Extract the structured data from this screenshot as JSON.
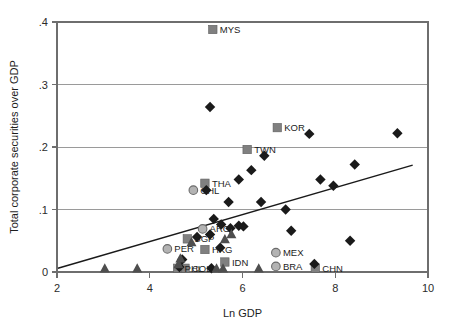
{
  "chart_data": {
    "type": "scatter",
    "title": "",
    "xlabel": "Ln GDP",
    "ylabel": "Total corporate securities over GDP",
    "xlim": [
      2,
      10
    ],
    "ylim": [
      0,
      0.4
    ],
    "xticks": [
      "2",
      "4",
      "6",
      "8",
      "10"
    ],
    "xtick_values": [
      2,
      4,
      6,
      8,
      10
    ],
    "yticks": [
      "0",
      ".1",
      ".2",
      ".3",
      ".4"
    ],
    "ytick_values": [
      0,
      0.1,
      0.2,
      0.3,
      0.4
    ],
    "grid": "horizontal",
    "legend_position": "none",
    "trendline": {
      "name": "fitted-line",
      "x_start": 2.02,
      "y_start": 0.006,
      "x_end": 9.67,
      "y_end": 0.171
    },
    "series": [
      {
        "name": "Labeled emerging markets",
        "marker": "square",
        "color": "#808080",
        "points": [
          {
            "label": "MYS",
            "x": 5.36,
            "y": 0.388
          },
          {
            "label": "KOR",
            "x": 6.75,
            "y": 0.231
          },
          {
            "label": "TWN",
            "x": 6.1,
            "y": 0.196
          },
          {
            "label": "THA",
            "x": 5.19,
            "y": 0.142
          },
          {
            "label": "SGP",
            "x": 4.81,
            "y": 0.053
          },
          {
            "label": "HKG",
            "x": 5.19,
            "y": 0.036
          },
          {
            "label": "IDN",
            "x": 5.62,
            "y": 0.016
          },
          {
            "label": "COL",
            "x": 4.76,
            "y": 0.006
          },
          {
            "label": "PHL",
            "x": 4.6,
            "y": 0.006
          },
          {
            "label": "CHN",
            "x": 7.57,
            "y": 0.006
          }
        ]
      },
      {
        "name": "Labeled emerging markets (circle)",
        "marker": "circle",
        "color": "#b3b3b3",
        "points": [
          {
            "label": "CHL",
            "x": 4.94,
            "y": 0.131
          },
          {
            "label": "ARG",
            "x": 5.14,
            "y": 0.069
          },
          {
            "label": "PER",
            "x": 4.38,
            "y": 0.037
          },
          {
            "label": "MEX",
            "x": 6.72,
            "y": 0.031
          },
          {
            "label": "BRA",
            "x": 6.72,
            "y": 0.009
          }
        ]
      },
      {
        "name": "Unlabeled observations (diamond)",
        "marker": "diamond",
        "color": "#1a1a1a",
        "points": [
          {
            "label": "",
            "x": 5.3,
            "y": 0.264
          },
          {
            "label": "",
            "x": 7.44,
            "y": 0.221
          },
          {
            "label": "",
            "x": 9.34,
            "y": 0.222
          },
          {
            "label": "",
            "x": 6.47,
            "y": 0.186
          },
          {
            "label": "",
            "x": 8.42,
            "y": 0.172
          },
          {
            "label": "",
            "x": 6.19,
            "y": 0.163
          },
          {
            "label": "",
            "x": 7.68,
            "y": 0.148
          },
          {
            "label": "",
            "x": 7.96,
            "y": 0.138
          },
          {
            "label": "",
            "x": 5.92,
            "y": 0.148
          },
          {
            "label": "",
            "x": 5.22,
            "y": 0.131
          },
          {
            "label": "",
            "x": 5.7,
            "y": 0.112
          },
          {
            "label": "",
            "x": 6.4,
            "y": 0.112
          },
          {
            "label": "",
            "x": 6.93,
            "y": 0.1
          },
          {
            "label": "",
            "x": 5.38,
            "y": 0.085
          },
          {
            "label": "",
            "x": 5.54,
            "y": 0.076
          },
          {
            "label": "",
            "x": 5.92,
            "y": 0.074
          },
          {
            "label": "",
            "x": 6.02,
            "y": 0.073
          },
          {
            "label": "",
            "x": 5.74,
            "y": 0.07
          },
          {
            "label": "",
            "x": 5.3,
            "y": 0.06
          },
          {
            "label": "",
            "x": 5.02,
            "y": 0.056
          },
          {
            "label": "",
            "x": 5.52,
            "y": 0.039
          },
          {
            "label": "",
            "x": 8.32,
            "y": 0.05
          },
          {
            "label": "",
            "x": 7.55,
            "y": 0.013
          },
          {
            "label": "",
            "x": 4.64,
            "y": 0.008
          },
          {
            "label": "",
            "x": 5.33,
            "y": 0.006
          },
          {
            "label": "",
            "x": 4.7,
            "y": 0.02
          },
          {
            "label": "",
            "x": 7.05,
            "y": 0.066
          }
        ]
      },
      {
        "name": "Unlabeled observations (triangle)",
        "marker": "triangle",
        "color": "#4e4e4e",
        "points": [
          {
            "label": "",
            "x": 3.03,
            "y": 0.006
          },
          {
            "label": "",
            "x": 3.73,
            "y": 0.006
          },
          {
            "label": "",
            "x": 4.66,
            "y": 0.022
          },
          {
            "label": "",
            "x": 5.44,
            "y": 0.006
          },
          {
            "label": "",
            "x": 5.58,
            "y": 0.006
          },
          {
            "label": "",
            "x": 6.35,
            "y": 0.006
          },
          {
            "label": "",
            "x": 5.62,
            "y": 0.053
          },
          {
            "label": "",
            "x": 4.9,
            "y": 0.048
          },
          {
            "label": "",
            "x": 4.62,
            "y": 0.013
          },
          {
            "label": "",
            "x": 5.76,
            "y": 0.061
          }
        ]
      }
    ]
  }
}
